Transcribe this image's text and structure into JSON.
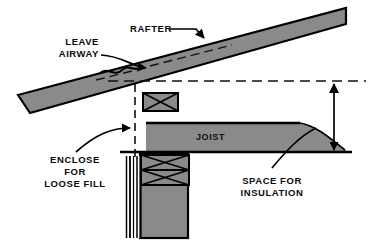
{
  "figure": {
    "type": "technical-construction-diagram"
  },
  "colors": {
    "background": "#ffffff",
    "member_fill": "#8a8a8a",
    "outline": "#000000",
    "text": "#0a0a0a",
    "insulation_fill": "#8a8a8a"
  },
  "labels": {
    "rafter": "RAFTER",
    "leave_airway_line1": "LEAVE",
    "leave_airway_line2": "AIRWAY",
    "joist": "JOIST",
    "enclose_line1": "ENCLOSE",
    "enclose_line2": "FOR",
    "enclose_line3": "LOOSE FILL",
    "space_line1": "SPACE FOR",
    "space_line2": "INSULATION"
  },
  "annotations": [
    {
      "name": "rafter-leader",
      "label": "RAFTER",
      "style": "straight-leader-with-arrow",
      "points_to": "rafter-member"
    },
    {
      "name": "leave-airway-leader",
      "label": "LEAVE AIRWAY",
      "style": "curved-leader-with-arrow",
      "points_to": "airway-gap-above-top-plate"
    },
    {
      "name": "enclose-loose-fill-leader",
      "label": "ENCLOSE FOR LOOSE FILL",
      "style": "curved-leader-with-arrow",
      "points_to": "baffle-dashed-line"
    },
    {
      "name": "space-for-insulation-leader",
      "label": "SPACE FOR INSULATION",
      "style": "curved-leader",
      "points_to": "insulation-taper-zone"
    },
    {
      "name": "insulation-depth-dimension",
      "label": "",
      "style": "double-headed-vertical-dimension",
      "points_to": "space-between-dashed-datum-and-ceiling-line"
    }
  ],
  "members": [
    {
      "name": "rafter-member",
      "label": "RAFTER",
      "fill": "#8a8a8a",
      "note": "sloping band across top of figure"
    },
    {
      "name": "joist-member",
      "label": "JOIST",
      "fill": "#8a8a8a",
      "note": "horizontal band to the right of wall"
    },
    {
      "name": "wall-member",
      "label": "",
      "fill": "#8a8a8a",
      "note": "vertical wall below the joist"
    },
    {
      "name": "top-plate-upper",
      "label": "",
      "fill": "#8a8a8a",
      "note": "x-braced blocking above joist"
    },
    {
      "name": "top-plate-mid",
      "label": "",
      "fill": "#8a8a8a",
      "note": "x-braced double top plate"
    },
    {
      "name": "top-plate-low",
      "label": "",
      "fill": "#8a8a8a",
      "note": "x-braced double top plate"
    },
    {
      "name": "insulation-taper",
      "label": "",
      "fill": "#8a8a8a",
      "note": "tapering insulation at eave"
    }
  ]
}
